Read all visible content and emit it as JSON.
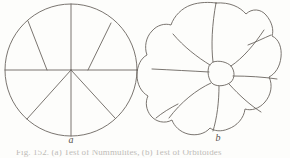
{
  "page": {
    "background_color": "#fdfdfb",
    "ink_color": "#6b6560",
    "width": 290,
    "height": 158
  },
  "figure": {
    "panels": [
      {
        "id": "a",
        "label": "a",
        "description": "idealized circular test outline with straight radial chamber divisions",
        "center": [
          71,
          70
        ],
        "radius": 66,
        "outline_type": "circle",
        "divisions": "straight"
      },
      {
        "id": "b",
        "label": "b",
        "description": "naturalistic lobed test outline with curved chamber sutures",
        "center": [
          217,
          69
        ],
        "radius": 65,
        "outline_type": "lobed",
        "lobe_count": 9,
        "divisions": "curved"
      }
    ]
  },
  "caption": {
    "text": "Fig. 152. (a) Test of Nummulites, (b) Test of Orbitoides",
    "visible": "cropped"
  },
  "colors": {
    "ink": "#6b6560",
    "label": "#58534e",
    "paper": "#fdfdfb"
  }
}
